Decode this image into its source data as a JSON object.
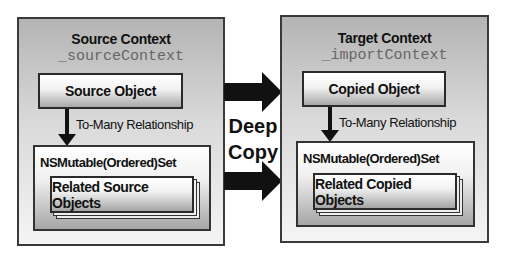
{
  "source": {
    "title": "Source Context",
    "variable": "_sourceContext",
    "object_label": "Source Object",
    "relationship_label": "To-Many Relationship",
    "set_label": "NSMutable(Ordered)Set",
    "related_label": "Related Source Objects"
  },
  "target": {
    "title": "Target Context",
    "variable": "_importContext",
    "object_label": "Copied Object",
    "relationship_label": "To-Many Relationship",
    "set_label": "NSMutable(Ordered)Set",
    "related_label": "Related Copied Objects"
  },
  "operation": {
    "line1": "Deep",
    "line2": "Copy",
    "arrow_icons": [
      "arrow-right-icon",
      "arrow-right-icon"
    ]
  },
  "colors": {
    "arrow": "#111111",
    "border": "#2a2a2a",
    "variable_text": "#666666"
  }
}
